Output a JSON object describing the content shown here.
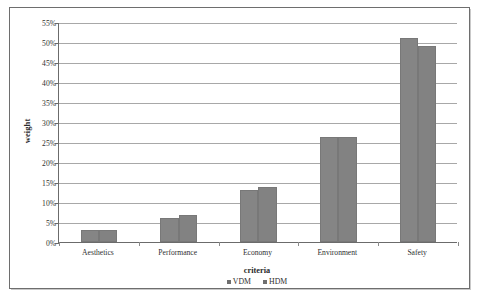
{
  "chart_data": {
    "type": "bar",
    "title": "",
    "subtitle": "",
    "xlabel": "criteria",
    "ylabel": "weight",
    "categories": [
      "Aesthetics",
      "Performance",
      "Economy",
      "Environment",
      "Safety"
    ],
    "series": [
      {
        "name": "VDM",
        "values": [
          3.1,
          6.1,
          13.0,
          26.2,
          51.0
        ]
      },
      {
        "name": "HDM",
        "values": [
          3.1,
          6.7,
          13.8,
          26.3,
          49.0
        ]
      }
    ],
    "ylim": [
      0,
      55
    ],
    "ytick_step": 5,
    "ytick_labels": [
      "0%",
      "5%",
      "10%",
      "15%",
      "20%",
      "25%",
      "30%",
      "35%",
      "40%",
      "45%",
      "50%",
      "55%"
    ],
    "value_format": "percent",
    "grid": "horizontal",
    "legend_position": "bottom",
    "colors": {
      "vdm_bar": "#858585",
      "hdm_bar": "#828282",
      "gridline": "#a8a8a8",
      "axis": "#6b6b6b",
      "frame": "#6e6e6e",
      "text": "#2f2f2f",
      "plot_background": "#ffffff"
    }
  },
  "legend": {
    "entries": [
      {
        "label": "VDM"
      },
      {
        "label": "HDM"
      }
    ]
  }
}
